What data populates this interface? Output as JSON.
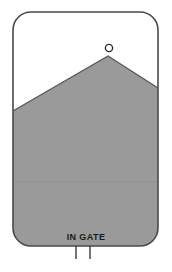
{
  "diagram": {
    "title": "IN GATE",
    "label": "IN GATE",
    "background_color": "#ffffff",
    "outline_color": "#4a4a4a",
    "fill_color": "#9a9a9a",
    "fill_edge_color": "#5a5a5a",
    "marker_color": "#2b2b2b",
    "label_color": "#1a1a1a",
    "tick_color": "#3a3a3a",
    "shapes": {
      "enclosure": {
        "name": "rounded-rectangle-outline",
        "x": 13,
        "y": 12,
        "width": 145,
        "height": 234,
        "corner_radius": 18
      },
      "filled_region": {
        "name": "gray-peak-region",
        "apex_x": 108,
        "apex_y": 56,
        "left_edge_y": 111,
        "right_edge_y": 88,
        "bottom_y": 246
      },
      "apex_marker": {
        "name": "apex-circle",
        "cx": 109,
        "cy": 48,
        "r": 3.6
      },
      "seam_line": {
        "name": "horizontal-seam",
        "y": 182
      },
      "ticks": [
        {
          "name": "tick-left",
          "x": 76,
          "y_top": 246,
          "y_bottom": 259
        },
        {
          "name": "tick-right",
          "x": 90,
          "y_top": 246,
          "y_bottom": 259
        }
      ]
    },
    "label_position": {
      "x": 86,
      "y": 240
    }
  }
}
